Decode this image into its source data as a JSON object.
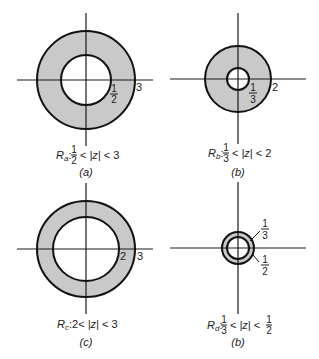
{
  "figure": {
    "colors": {
      "ring_fill": "#c9c9c9",
      "stroke": "#111111",
      "background": "#ffffff"
    },
    "panels": [
      {
        "id": "a",
        "region_symbol": "R",
        "region_sub": "a",
        "inner_radius_label": "1/2",
        "inner_num": "1",
        "inner_den": "2",
        "outer_radius_label": "3",
        "inequality_lt": "<",
        "abs_z": "|z|",
        "upper": "3",
        "caption": "Ra: 1/2 < |z| < 3",
        "sublabel": "(a)"
      },
      {
        "id": "b",
        "region_symbol": "R",
        "region_sub": "b",
        "inner_radius_label": "1/3",
        "inner_num": "1",
        "inner_den": "3",
        "outer_radius_label": "2",
        "inequality_lt": "<",
        "abs_z": "|z|",
        "upper": "2",
        "caption": "Rb: 1/3 < |z| < 2",
        "sublabel": "(b)"
      },
      {
        "id": "c",
        "region_symbol": "R",
        "region_sub": "c",
        "inner_radius_label": "2",
        "outer_radius_label": "3",
        "lower": "2",
        "inequality_lt": "<",
        "abs_z": "|z|",
        "upper": "3",
        "caption": "Rc: 2 < |z| < 3",
        "sublabel": "(c)"
      },
      {
        "id": "d",
        "region_symbol": "R",
        "region_sub": "d",
        "inner_radius_label": "1/3",
        "inner_num": "1",
        "inner_den": "3",
        "outer_radius_label": "1/2",
        "outer_num": "1",
        "outer_den": "2",
        "inequality_lt": "<",
        "abs_z": "|z|",
        "caption": "Rd: 1/3 < |z| < 1/2",
        "sublabel": "(b)"
      }
    ]
  }
}
